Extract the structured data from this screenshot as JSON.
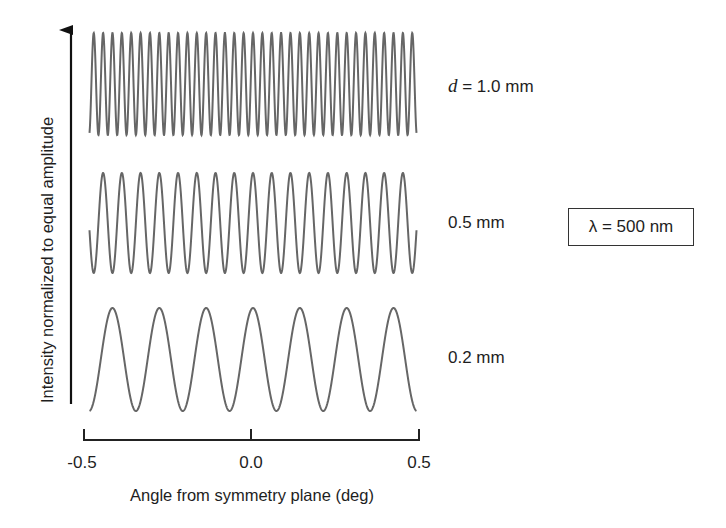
{
  "chart_data": {
    "type": "line",
    "title": "",
    "xlabel": "Angle from symmetry plane (deg)",
    "ylabel": "Intensity normalized to equal amplitude",
    "xlim": [
      -0.5,
      0.5
    ],
    "x_ticks": [
      -0.5,
      0.0,
      0.5
    ],
    "x_tick_labels": [
      "-0.5",
      "0.0",
      "0.5"
    ],
    "grid": false,
    "legend": null,
    "wavelength_nm": 500,
    "annotation": "λ = 500 nm",
    "model": "I(θ) = cos²(π·d·θ/λ), normalized 0–1, traces vertically offset",
    "series": [
      {
        "name": "d = 1.0 mm",
        "d_mm": 1.0,
        "label_prefix": "d",
        "label_value": " = 1.0 mm",
        "fringes_in_range": 34.9,
        "offset_rank": 3
      },
      {
        "name": "0.5 mm",
        "d_mm": 0.5,
        "label_value": "0.5 mm",
        "fringes_in_range": 17.5,
        "offset_rank": 2
      },
      {
        "name": "0.2 mm",
        "d_mm": 0.2,
        "label_value": "0.2 mm",
        "fringes_in_range": 7.0,
        "offset_rank": 1
      }
    ],
    "line_color": "#666666"
  },
  "labels": {
    "d_italic": "d",
    "top_suffix": " = 1.0 mm",
    "mid": "0.5 mm",
    "bottom": "0.2 mm",
    "lambda": "λ = 500 nm",
    "xlabel": "Angle from symmetry plane (deg)",
    "ylabel": "Intensity normalized to equal amplitude",
    "tick_left": "-0.5",
    "tick_mid": "0.0",
    "tick_right": "0.5"
  }
}
